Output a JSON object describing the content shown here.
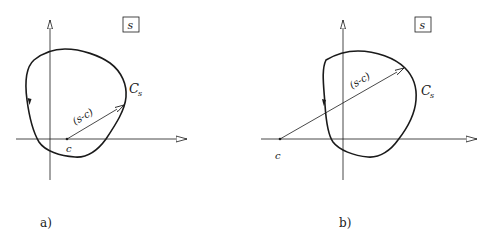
{
  "panels": [
    {
      "id": "a",
      "caption": "a)",
      "box_label": "s",
      "curve_label": "C",
      "curve_label_sub": "s",
      "vector_label": "(s-c)",
      "point_label": "c",
      "description": "Point c lies inside the contour C_s; vector (s-c) from c to a point on the contour"
    },
    {
      "id": "b",
      "caption": "b)",
      "box_label": "s",
      "curve_label": "C",
      "curve_label_sub": "s",
      "vector_label": "(s-c)",
      "point_label": "c",
      "description": "Point c lies outside the contour C_s; vector (s-c) crosses the contour"
    }
  ]
}
